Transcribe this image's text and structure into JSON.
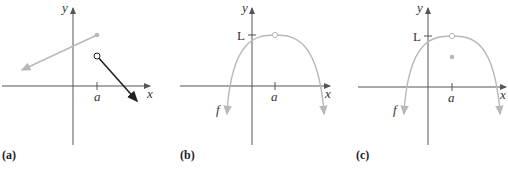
{
  "panels": [
    {
      "caption": "(a)",
      "axis_x_label": "x",
      "axis_y_label": "y",
      "tick_label": "a",
      "description": "Piecewise linear function with jump at a: left ray (gray) ending with filled dot, right ray (black) starting with open circle"
    },
    {
      "caption": "(b)",
      "axis_x_label": "x",
      "axis_y_label": "y",
      "tick_label": "a",
      "y_tick_label": "L",
      "curve_label": "f",
      "description": "Downward parabola with hole (open circle) at (a, L)"
    },
    {
      "caption": "(c)",
      "axis_x_label": "x",
      "axis_y_label": "y",
      "tick_label": "a",
      "y_tick_label": "L",
      "curve_label": "f",
      "description": "Downward parabola with hole at (a, L) and filled point below at x = a"
    }
  ],
  "colors": {
    "axis": "#555555",
    "curve_gray": "#b8b8b8",
    "ray_black": "#222222"
  }
}
